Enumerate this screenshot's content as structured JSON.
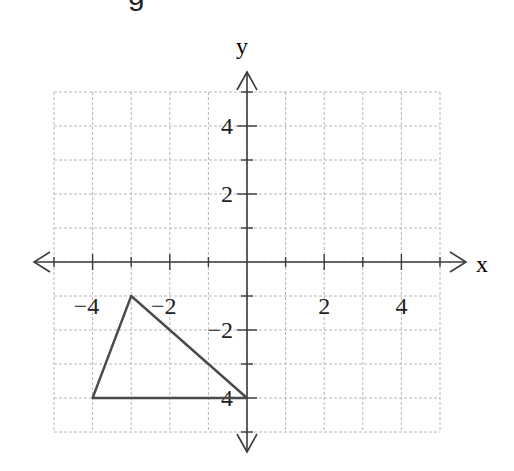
{
  "header": {
    "cut_text": "g"
  },
  "chart_data": {
    "type": "line",
    "title": "",
    "xlabel": "x",
    "ylabel": "y",
    "xlim": [
      -5,
      5
    ],
    "ylim": [
      -5,
      5
    ],
    "grid": true,
    "x_tick_labels": [
      "-4",
      "-2",
      "2",
      "4"
    ],
    "x_tick_values": [
      -4,
      -2,
      2,
      4
    ],
    "y_tick_labels": [
      "4",
      "2",
      "-2",
      "-4"
    ],
    "y_tick_values": [
      4,
      2,
      -2,
      -4
    ],
    "series": [
      {
        "name": "triangle",
        "closed": true,
        "points": [
          [
            -4,
            -4
          ],
          [
            -3,
            -1
          ],
          [
            0,
            -4
          ]
        ]
      }
    ]
  },
  "colors": {
    "axis": "#3a3a3a",
    "grid": "#b8b8b8",
    "shape": "#4a4a4a",
    "text": "#222222"
  }
}
